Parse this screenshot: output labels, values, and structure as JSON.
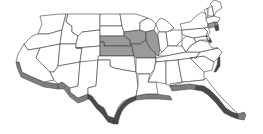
{
  "map": {
    "title": "United States map (3D extruded)",
    "style": "grayscale extruded clipart",
    "colors": {
      "background": "#ffffff",
      "state_fill": "#ffffff",
      "highlight_fill": "#9a9a9a",
      "border": "#3a3a3a",
      "extrusion_side": "#7d7d7d",
      "extrusion_shadow": "#4a4a4a"
    },
    "highlighted_states": [
      "Nebraska",
      "Kansas",
      "Iowa",
      "Missouri",
      "Illinois",
      "Connecticut"
    ],
    "regions": [
      {
        "name": "Washington"
      },
      {
        "name": "Oregon"
      },
      {
        "name": "California"
      },
      {
        "name": "Idaho"
      },
      {
        "name": "Nevada"
      },
      {
        "name": "Utah"
      },
      {
        "name": "Arizona"
      },
      {
        "name": "Montana"
      },
      {
        "name": "Wyoming"
      },
      {
        "name": "Colorado"
      },
      {
        "name": "New Mexico"
      },
      {
        "name": "North Dakota"
      },
      {
        "name": "South Dakota"
      },
      {
        "name": "Nebraska"
      },
      {
        "name": "Kansas"
      },
      {
        "name": "Oklahoma"
      },
      {
        "name": "Texas"
      },
      {
        "name": "Minnesota"
      },
      {
        "name": "Iowa"
      },
      {
        "name": "Missouri"
      },
      {
        "name": "Arkansas"
      },
      {
        "name": "Louisiana"
      },
      {
        "name": "Wisconsin"
      },
      {
        "name": "Illinois"
      },
      {
        "name": "Michigan"
      },
      {
        "name": "Indiana"
      },
      {
        "name": "Ohio"
      },
      {
        "name": "Kentucky"
      },
      {
        "name": "Tennessee"
      },
      {
        "name": "Mississippi"
      },
      {
        "name": "Alabama"
      },
      {
        "name": "Georgia"
      },
      {
        "name": "Florida"
      },
      {
        "name": "South Carolina"
      },
      {
        "name": "North Carolina"
      },
      {
        "name": "Virginia"
      },
      {
        "name": "West Virginia"
      },
      {
        "name": "Pennsylvania"
      },
      {
        "name": "New York"
      },
      {
        "name": "New Jersey"
      },
      {
        "name": "Maryland"
      },
      {
        "name": "Delaware"
      },
      {
        "name": "Connecticut"
      },
      {
        "name": "Massachusetts"
      },
      {
        "name": "Vermont"
      },
      {
        "name": "New Hampshire"
      },
      {
        "name": "Maine"
      }
    ]
  }
}
